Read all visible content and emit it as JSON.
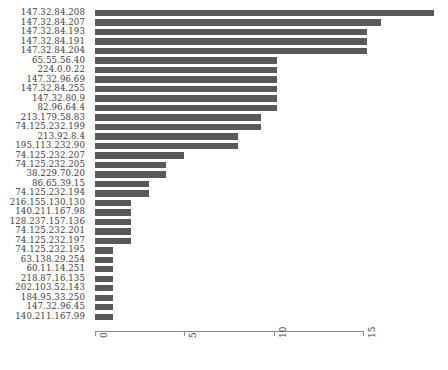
{
  "chart_data": {
    "type": "bar",
    "orientation": "horizontal",
    "title": "",
    "xlabel": "",
    "ylabel": "",
    "xlim": [
      0,
      19.5
    ],
    "xticks": [
      0,
      5,
      10,
      15
    ],
    "xticklabels": [
      "0",
      "5",
      "10",
      "15"
    ],
    "grid": false,
    "legend": null,
    "bar_color": "#595959",
    "categories": [
      "147.32.84.208",
      "147.32.84.207",
      "147.32.84.193",
      "147.32.84.191",
      "147.32.84.204",
      "65.55.56.40",
      "224.0.0.22",
      "147.32.96.69",
      "147.32.84.255",
      "147.32.80.9",
      "82.96.64.4",
      "213.179.58.83",
      "74.125.232.199",
      "213.92.8.4",
      "195.113.232.90",
      "74.125.232.207",
      "74.125.232.205",
      "38.229.70.20",
      "86.65.39.15",
      "74.125.232.194",
      "216.155.130.130",
      "140.211.167.98",
      "128.237.157.136",
      "74.125.232.201",
      "74.125.232.197",
      "74.125.232.195",
      "63.138.29.254",
      "60.11.14.251",
      "218.87.16.135",
      "202.103.52.143",
      "184.95.33.250",
      "147.32.96.45",
      "140.211.167.99"
    ],
    "values": [
      19,
      16,
      15.2,
      15.2,
      15.2,
      10.2,
      10.2,
      10.2,
      10.2,
      10.2,
      10.2,
      9.3,
      9.3,
      8,
      8,
      5,
      4,
      4,
      3,
      3,
      2,
      2,
      2,
      2,
      2,
      1,
      1,
      1,
      1,
      1,
      1,
      1,
      1
    ]
  }
}
